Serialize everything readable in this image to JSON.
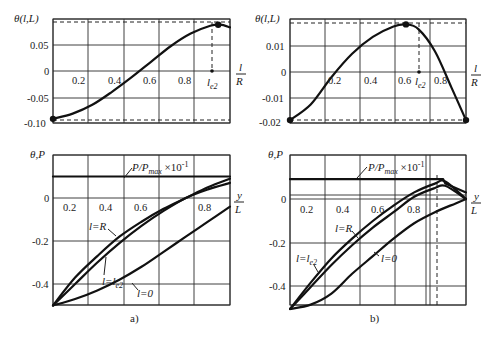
{
  "figure": {
    "captions": [
      "a)",
      "b)"
    ]
  },
  "chart_data": [
    {
      "id": "a-top",
      "type": "line",
      "panel": "a)",
      "title": "",
      "ylabel": "θ(l,L)",
      "xlabel": "l/R",
      "xlabel_num": "l",
      "xlabel_den": "R",
      "x_ticks": [
        "0.2",
        "0.4",
        "0.6",
        "0.8"
      ],
      "y_ticks": [
        "0.05",
        "0",
        "-0.05",
        "-0.10"
      ],
      "xlim": [
        0.1,
        1.0
      ],
      "ylim": [
        -0.1,
        0.09
      ],
      "grid": true,
      "annotation": "l_e2",
      "annotation_main": "l",
      "annotation_sub": "e2",
      "series": [
        {
          "name": "θ(l,L)",
          "x": [
            0.1,
            0.2,
            0.3,
            0.4,
            0.5,
            0.6,
            0.7,
            0.8,
            0.9,
            0.95,
            1.0
          ],
          "values": [
            -0.092,
            -0.082,
            -0.065,
            -0.04,
            -0.012,
            0.018,
            0.048,
            0.072,
            0.087,
            0.089,
            0.084
          ]
        }
      ],
      "extremes": {
        "max": {
          "x": 0.94,
          "y": 0.089
        },
        "min": {
          "x": 0.1,
          "y": -0.092
        }
      }
    },
    {
      "id": "b-top",
      "type": "line",
      "panel": "b)",
      "ylabel": "θ(l,L)",
      "xlabel": "l/R",
      "xlabel_num": "l",
      "xlabel_den": "R",
      "x_ticks": [
        "0.2",
        "0.4",
        "0.6",
        "0.8"
      ],
      "y_ticks": [
        "0.01",
        "0",
        "-0.01",
        "-0.02"
      ],
      "xlim": [
        0.1,
        0.95
      ],
      "ylim": [
        -0.02,
        0.018
      ],
      "grid": true,
      "annotation": "l_e2",
      "annotation_main": "l",
      "annotation_sub": "e2",
      "series": [
        {
          "name": "θ(l,L)",
          "x": [
            0.1,
            0.2,
            0.3,
            0.4,
            0.5,
            0.6,
            0.66,
            0.72,
            0.8,
            0.88,
            0.95
          ],
          "values": [
            -0.0185,
            -0.0125,
            -0.002,
            0.007,
            0.0135,
            0.0175,
            0.0183,
            0.0165,
            0.008,
            -0.006,
            -0.0185
          ]
        }
      ],
      "extremes": {
        "max": {
          "x": 0.66,
          "y": 0.0183
        },
        "min_left": {
          "x": 0.1,
          "y": -0.0185
        },
        "min_right": {
          "x": 0.95,
          "y": -0.0185
        }
      }
    },
    {
      "id": "a-bottom",
      "type": "line",
      "panel": "a)",
      "ylabel": "θ,P",
      "xlabel": "y/L",
      "xlabel_num": "y",
      "xlabel_den": "L",
      "x_ticks": [
        "0.2",
        "0.4",
        "0.6",
        "0.8"
      ],
      "y_ticks": [
        "0",
        "-0.2",
        "-0.4"
      ],
      "xlim": [
        0.1,
        0.9
      ],
      "ylim": [
        -0.5,
        0.15
      ],
      "grid": true,
      "series": [
        {
          "name": "P/Pmax ×10^-1",
          "label_main": "P/P",
          "label_sub": "max",
          "label_tail": " ×10",
          "label_sup": "-1",
          "x": [
            0.1,
            0.9
          ],
          "values": [
            0.1,
            0.1
          ]
        },
        {
          "name": "l=R",
          "label": "l=R",
          "x": [
            0.1,
            0.2,
            0.3,
            0.4,
            0.5,
            0.6,
            0.7,
            0.8,
            0.9
          ],
          "values": [
            -0.5,
            -0.37,
            -0.27,
            -0.18,
            -0.11,
            -0.05,
            0.0,
            0.05,
            0.09
          ]
        },
        {
          "name": "l=l_e2",
          "label_main": "l=l",
          "label_sub": "e2",
          "x": [
            0.1,
            0.2,
            0.3,
            0.4,
            0.5,
            0.6,
            0.7,
            0.8,
            0.9
          ],
          "values": [
            -0.5,
            -0.4,
            -0.3,
            -0.21,
            -0.13,
            -0.06,
            0.0,
            0.04,
            0.07
          ]
        },
        {
          "name": "l=0",
          "label": "l=0",
          "x": [
            0.1,
            0.2,
            0.3,
            0.4,
            0.5,
            0.6,
            0.7,
            0.8,
            0.9
          ],
          "values": [
            -0.5,
            -0.47,
            -0.43,
            -0.38,
            -0.32,
            -0.25,
            -0.18,
            -0.11,
            -0.04
          ]
        }
      ]
    },
    {
      "id": "b-bottom",
      "type": "line",
      "panel": "b)",
      "ylabel": "θ,P",
      "xlabel": "y/L",
      "xlabel_num": "y",
      "xlabel_den": "L",
      "x_ticks": [
        "0.2",
        "0.4",
        "0.6",
        "0.8"
      ],
      "y_ticks": [
        "0",
        "-0.2",
        "-0.4"
      ],
      "xlim": [
        0.1,
        0.95
      ],
      "ylim": [
        -0.5,
        0.15
      ],
      "grid": true,
      "dashed_vertical_x": 0.85,
      "series": [
        {
          "name": "P/Pmax ×10^-1",
          "label_main": "P/P",
          "label_sub": "max",
          "label_tail": " ×10",
          "label_sup": "-1",
          "x": [
            0.1,
            0.84,
            0.85,
            0.95
          ],
          "values": [
            0.09,
            0.09,
            0.07,
            0.03
          ]
        },
        {
          "name": "l=R",
          "label": "l=R",
          "x": [
            0.1,
            0.2,
            0.3,
            0.4,
            0.5,
            0.6,
            0.7,
            0.8,
            0.85,
            0.95
          ],
          "values": [
            -0.5,
            -0.38,
            -0.27,
            -0.18,
            -0.1,
            -0.03,
            0.03,
            0.07,
            0.08,
            0.0
          ]
        },
        {
          "name": "l=l_e2",
          "label_main": "l=l",
          "label_sub": "e2",
          "x": [
            0.1,
            0.2,
            0.3,
            0.4,
            0.5,
            0.6,
            0.7,
            0.8,
            0.85,
            0.95
          ],
          "values": [
            -0.5,
            -0.4,
            -0.3,
            -0.21,
            -0.13,
            -0.06,
            0.01,
            0.05,
            0.06,
            0.0
          ]
        },
        {
          "name": "l=0",
          "label": "l=0",
          "x": [
            0.1,
            0.2,
            0.3,
            0.4,
            0.5,
            0.6,
            0.7,
            0.8,
            0.9,
            0.95
          ],
          "values": [
            -0.5,
            -0.48,
            -0.43,
            -0.34,
            -0.26,
            -0.18,
            -0.11,
            -0.06,
            -0.02,
            0.0
          ]
        }
      ]
    }
  ]
}
